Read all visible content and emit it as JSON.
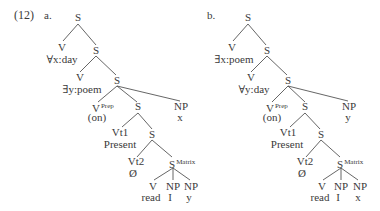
{
  "example_number": "(12)",
  "trees": [
    {
      "label": "a.",
      "nodes": {
        "root": "S",
        "v1": "V",
        "v1_term": "∀x:day",
        "s1": "S",
        "v2": "V",
        "v2_term": "∃y:poem",
        "s2": "S",
        "vprep": "V",
        "vprep_sup": "Prep",
        "vprep_term": "(on)",
        "s3": "S",
        "np_outer": "NP",
        "np_outer_term": "x",
        "vt1": "Vt1",
        "vt1_term": "Present",
        "s4": "S",
        "vt2": "Vt2",
        "vt2_term": "Ø",
        "smatrix": "S",
        "smatrix_sup": "Matrix",
        "v_leaf": "V",
        "v_leaf_term": "read",
        "np1": "NP",
        "np1_term": "I",
        "np2": "NP",
        "np2_term": "y"
      }
    },
    {
      "label": "b.",
      "nodes": {
        "root": "S",
        "v1": "V",
        "v1_term": "∃x:poem",
        "s1": "S",
        "v2": "V",
        "v2_term": "∀y:day",
        "s2": "S",
        "vprep": "V",
        "vprep_sup": "Prep",
        "vprep_term": "(on)",
        "s3": "S",
        "np_outer": "NP",
        "np_outer_term": "y",
        "vt1": "Vt1",
        "vt1_term": "Present",
        "s4": "S",
        "vt2": "Vt2",
        "vt2_term": "Ø",
        "smatrix": "S",
        "smatrix_sup": "Matrix",
        "v_leaf": "V",
        "v_leaf_term": "read",
        "np1": "NP",
        "np1_term": "I",
        "np2": "NP",
        "np2_term": "x"
      }
    }
  ]
}
